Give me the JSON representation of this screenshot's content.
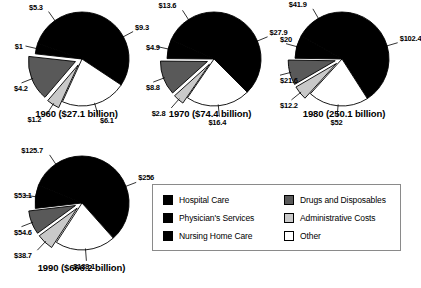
{
  "chart_data": {
    "type": "pie",
    "title": "",
    "legend_position": "bottom-right",
    "categories": [
      "Hospital Care",
      "Physician's Services",
      "Nursing Home Care",
      "Drugs and Disposables",
      "Administrative Costs",
      "Other"
    ],
    "category_colors": [
      "#000000",
      "#000000",
      "#000000",
      "#595959",
      "#c9c9c9",
      "#ffffff"
    ],
    "units": "billions of dollars",
    "charts": [
      {
        "id": "pie-1960",
        "caption": "1960 ($27.1 billion)",
        "year": "1960",
        "total": 27.1,
        "slices": [
          {
            "category": "Hospital Care",
            "label": "$9.3",
            "value": 9.3,
            "color": "#000000",
            "exploded": false
          },
          {
            "category": "Other",
            "label": "$6.1",
            "value": 6.1,
            "color": "#ffffff",
            "exploded": false
          },
          {
            "category": "Administrative Costs",
            "label": "$1.2",
            "value": 1.2,
            "color": "#c9c9c9",
            "exploded": true
          },
          {
            "category": "Drugs and Disposables",
            "label": "$4.2",
            "value": 4.2,
            "color": "#595959",
            "exploded": true
          },
          {
            "category": "Nursing Home Care",
            "label": "$1",
            "value": 1.0,
            "color": "#000000",
            "exploded": false
          },
          {
            "category": "Physician's Services",
            "label": "$5.3",
            "value": 5.3,
            "color": "#000000",
            "exploded": false
          }
        ]
      },
      {
        "id": "pie-1970",
        "caption": "1970 ($74.4 billion)",
        "year": "1970",
        "total": 74.4,
        "slices": [
          {
            "category": "Hospital Care",
            "label": "$27.9",
            "value": 27.9,
            "color": "#000000",
            "exploded": false
          },
          {
            "category": "Other",
            "label": "$16.4",
            "value": 16.4,
            "color": "#ffffff",
            "exploded": false
          },
          {
            "category": "Administrative Costs",
            "label": "$2.8",
            "value": 2.8,
            "color": "#c9c9c9",
            "exploded": true
          },
          {
            "category": "Drugs and Disposables",
            "label": "$8.8",
            "value": 8.8,
            "color": "#595959",
            "exploded": true
          },
          {
            "category": "Nursing Home Care",
            "label": "$4.9",
            "value": 4.9,
            "color": "#000000",
            "exploded": false
          },
          {
            "category": "Physician's Services",
            "label": "$13.6",
            "value": 13.6,
            "color": "#000000",
            "exploded": false
          }
        ]
      },
      {
        "id": "pie-1980",
        "caption": "1980 (250.1 billion)",
        "year": "1980",
        "total": 250.1,
        "slices": [
          {
            "category": "Hospital Care",
            "label": "$102.4",
            "value": 102.4,
            "color": "#000000",
            "exploded": false
          },
          {
            "category": "Other",
            "label": "$52",
            "value": 52.0,
            "color": "#ffffff",
            "exploded": false
          },
          {
            "category": "Administrative Costs",
            "label": "$12.2",
            "value": 12.2,
            "color": "#c9c9c9",
            "exploded": true
          },
          {
            "category": "Drugs and Disposables",
            "label": "$21.6",
            "value": 21.6,
            "color": "#595959",
            "exploded": true
          },
          {
            "category": "Nursing Home Care",
            "label": "$20",
            "value": 20.0,
            "color": "#000000",
            "exploded": false
          },
          {
            "category": "Physician's Services",
            "label": "$41.9",
            "value": 41.9,
            "color": "#000000",
            "exploded": false
          }
        ]
      },
      {
        "id": "pie-1990",
        "caption": "1990 ($666.2 billion)",
        "year": "1990",
        "total": 666.2,
        "slices": [
          {
            "category": "Hospital Care",
            "label": "$256",
            "value": 256.0,
            "color": "#000000",
            "exploded": false
          },
          {
            "category": "Other",
            "label": "$138.1",
            "value": 138.1,
            "color": "#ffffff",
            "exploded": false
          },
          {
            "category": "Administrative Costs",
            "label": "$38.7",
            "value": 38.7,
            "color": "#c9c9c9",
            "exploded": true
          },
          {
            "category": "Drugs and Disposables",
            "label": "$54.6",
            "value": 54.6,
            "color": "#595959",
            "exploded": true
          },
          {
            "category": "Nursing Home Care",
            "label": "$53.1",
            "value": 53.1,
            "color": "#000000",
            "exploded": false
          },
          {
            "category": "Physician's Services",
            "label": "$125.7",
            "value": 125.7,
            "color": "#000000",
            "exploded": false
          }
        ]
      }
    ]
  },
  "legend": {
    "items": [
      {
        "label": "Hospital Care",
        "color": "#000000",
        "name": "hospital-care"
      },
      {
        "label": "Physician's Services",
        "color": "#000000",
        "name": "physicians-services"
      },
      {
        "label": "Nursing Home Care",
        "color": "#000000",
        "name": "nursing-home-care"
      },
      {
        "label": "Drugs and Disposables",
        "color": "#595959",
        "name": "drugs-and-disposables"
      },
      {
        "label": "Administrative Costs",
        "color": "#c9c9c9",
        "name": "administrative-costs"
      },
      {
        "label": "Other",
        "color": "#ffffff",
        "name": "other"
      }
    ]
  },
  "layout": {
    "pies": [
      {
        "x": 14,
        "y": 2,
        "w": 125,
        "h": 128,
        "cx": 68,
        "cy": 57,
        "r": 47,
        "caption_y": 108
      },
      {
        "x": 146,
        "y": 2,
        "w": 128,
        "h": 128,
        "cx": 68,
        "cy": 57,
        "r": 47,
        "caption_y": 108
      },
      {
        "x": 280,
        "y": 2,
        "w": 128,
        "h": 128,
        "cx": 62,
        "cy": 57,
        "r": 47,
        "caption_y": 108
      },
      {
        "x": 14,
        "y": 148,
        "w": 135,
        "h": 133,
        "cx": 68,
        "cy": 55,
        "r": 47,
        "caption_y": 262
      }
    ],
    "value_labels": [
      {
        "pie": 0,
        "text_ref": "0.0",
        "x": 72,
        "y": 7,
        "leader": {
          "x1": 70,
          "y1": 16,
          "x2": 82,
          "y2": 23
        }
      },
      {
        "pie": 0,
        "text_ref": "0.1",
        "x": 106,
        "y": 84,
        "leader": {
          "x1": 104,
          "y1": 83,
          "x2": 96,
          "y2": 76
        }
      },
      {
        "pie": 0,
        "text_ref": "0.2",
        "x": 63,
        "y": 99,
        "leader": {
          "x1": 70,
          "y1": 98,
          "x2": 70,
          "y2": 86
        }
      },
      {
        "pie": 0,
        "text_ref": "0.3",
        "x": 18,
        "y": 94,
        "leader": {
          "x1": 34,
          "y1": 94,
          "x2": 41,
          "y2": 87
        }
      },
      {
        "pie": 0,
        "text_ref": "0.4",
        "x": 8,
        "y": 61,
        "leader": {
          "x1": 20,
          "y1": 62,
          "x2": 28,
          "y2": 62
        }
      },
      {
        "pie": 0,
        "text_ref": "0.5",
        "x": 9,
        "y": 14,
        "leader": {
          "x1": 26,
          "y1": 20,
          "x2": 34,
          "y2": 26
        }
      }
    ]
  }
}
